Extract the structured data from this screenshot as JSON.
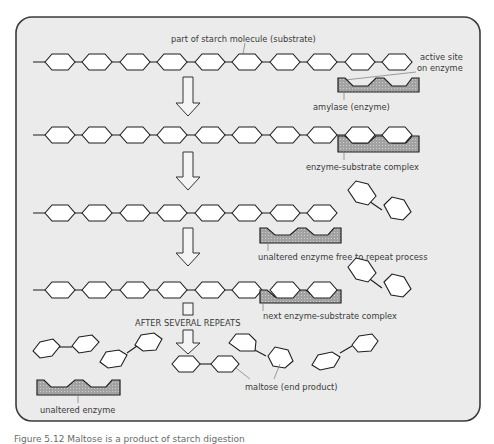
{
  "colors": {
    "panel_bg": "#ebebeb",
    "panel_border": "#3b3b3b",
    "hexagon_fill": "#ffffff",
    "hexagon_stroke": "#1e1e1e",
    "enzyme_fill": "#9a9a9a",
    "label_text": "#3a3a3a"
  },
  "labels": {
    "starch": "part of starch molecule (substrate)",
    "active_site_line1": "active site",
    "active_site_line2": "on enzyme",
    "amylase": "amylase (enzyme)",
    "complex": "enzyme-substrate complex",
    "free_enzyme": "unaltered enzyme free to repeat process",
    "next_complex": "next enzyme-substrate complex",
    "after_repeats": "AFTER SEVERAL REPEATS",
    "maltose": "maltose (end product)",
    "unaltered_enzyme": "unaltered enzyme"
  },
  "caption": "Figure 5.12  Maltose is a product of starch digestion"
}
